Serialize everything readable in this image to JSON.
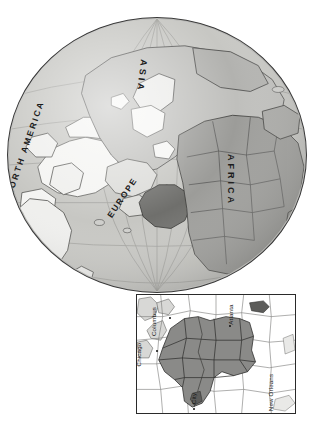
{
  "figure": {
    "type": "locator-map",
    "title": ""
  },
  "globe": {
    "name": "orthographic-globe",
    "center_region": "Europe / Mediterranean",
    "highlight_region": "Turkey / Eastern Mediterranean",
    "labels": [
      {
        "id": "north-america",
        "text": "NORTH AMERICA"
      },
      {
        "id": "asia",
        "text": "ASIA"
      },
      {
        "id": "europe",
        "text": "EUROPE"
      },
      {
        "id": "africa",
        "text": "AFRICA"
      }
    ],
    "colors": {
      "ocean": "#c4c4c1",
      "land_light": "#f2f2f0",
      "land_mid": "#bdbdba",
      "land_dark": "#9a9a97",
      "highlight": "#6e6e6b",
      "outline": "#3a3a3a",
      "graticule": "#8f8f8c"
    },
    "graticule": {
      "meridians": 7,
      "parallels": 5,
      "visible": true
    }
  },
  "inset": {
    "name": "regional-inset-map",
    "border_color": "#2a2a2a",
    "shaded_region_color": "#8a8a88",
    "land_color": "#ffffff",
    "cities": [
      {
        "id": "chicago",
        "label": "Chicago"
      },
      {
        "id": "columbus",
        "label": "Columbus"
      },
      {
        "id": "atlanta",
        "label": "Atlanta"
      },
      {
        "id": "new-orleans",
        "label": "New Orleans"
      },
      {
        "id": "kansas-city",
        "label": "City"
      }
    ]
  }
}
